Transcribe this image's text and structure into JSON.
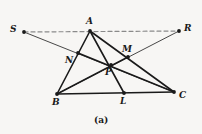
{
  "figure": {
    "caption": "(a)",
    "caption_pos": {
      "x": 94,
      "y": 116
    },
    "background_color": "#f7f6f4",
    "stroke_color": "#1a1a1a",
    "dash_color": "#8a8a8a",
    "width": 202,
    "height": 134
  },
  "points": [
    {
      "id": "S",
      "label": "S",
      "x": 24,
      "y": 32,
      "dot": true,
      "label_x": 10,
      "label_y": 25
    },
    {
      "id": "A",
      "label": "A",
      "x": 90,
      "y": 31,
      "dot": true,
      "label_x": 86,
      "label_y": 17
    },
    {
      "id": "R",
      "label": "R",
      "x": 179,
      "y": 31,
      "dot": true,
      "label_x": 184,
      "label_y": 24
    },
    {
      "id": "N",
      "label": "N",
      "x": 78,
      "y": 53,
      "dot": true,
      "label_x": 65,
      "label_y": 56
    },
    {
      "id": "M",
      "label": "M",
      "x": 128,
      "y": 57,
      "dot": true,
      "label_x": 122,
      "label_y": 45
    },
    {
      "id": "P",
      "label": "P",
      "x": 111,
      "y": 65,
      "dot": true,
      "label_x": 105,
      "label_y": 68
    },
    {
      "id": "B",
      "label": "B",
      "x": 57,
      "y": 94,
      "dot": true,
      "label_x": 52,
      "label_y": 98
    },
    {
      "id": "L",
      "label": "L",
      "x": 124,
      "y": 93,
      "dot": true,
      "label_x": 120,
      "label_y": 97
    },
    {
      "id": "C",
      "label": "C",
      "x": 174,
      "y": 92,
      "dot": true,
      "label_x": 179,
      "label_y": 91
    }
  ],
  "segments": [
    {
      "name": "segment-AB",
      "from": "A",
      "to": "B",
      "weight": 1.6,
      "style": "solid"
    },
    {
      "name": "segment-AC",
      "from": "A",
      "to": "C",
      "weight": 1.6,
      "style": "solid"
    },
    {
      "name": "segment-BC",
      "from": "B",
      "to": "C",
      "weight": 1.6,
      "style": "solid"
    },
    {
      "name": "cevian-AL",
      "from": "A",
      "to": "L",
      "weight": 1.6,
      "style": "solid"
    },
    {
      "name": "cevian-BM",
      "from": "B",
      "to": "M",
      "weight": 1.6,
      "style": "solid"
    },
    {
      "name": "cevian-CN",
      "from": "C",
      "to": "N",
      "weight": 1.6,
      "style": "solid"
    },
    {
      "name": "ray-S-to-C",
      "from": "S",
      "to": "C",
      "weight": 0.8,
      "style": "solid"
    },
    {
      "name": "ray-R-to-B",
      "from": "R",
      "to": "B",
      "weight": 0.8,
      "style": "solid"
    },
    {
      "name": "dashed-line-SAR",
      "from": "S",
      "to": "R",
      "weight": 1.2,
      "style": "dashed"
    }
  ]
}
